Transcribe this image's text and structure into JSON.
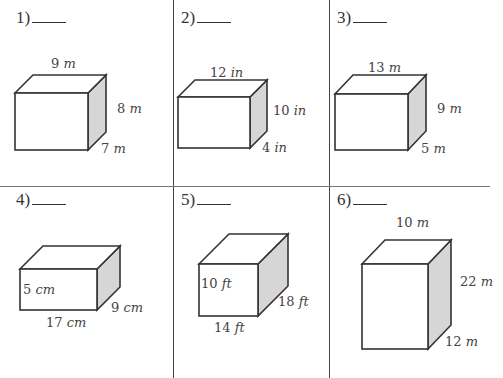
{
  "worksheet": {
    "cut_off_header": "…find the volume of each rectangular prism…",
    "problems": [
      {
        "number": "1)",
        "answer_blank": "",
        "length": "9",
        "height": "8",
        "width": "7",
        "unit": "m",
        "labels": {
          "top": "9 m",
          "right": "8 m",
          "depth": "7 m"
        }
      },
      {
        "number": "2)",
        "answer_blank": "",
        "length": "12",
        "height": "10",
        "width": "4",
        "unit": "in",
        "labels": {
          "top": "12 in",
          "right": "10 in",
          "depth": "4 in"
        }
      },
      {
        "number": "3)",
        "answer_blank": "",
        "length": "13",
        "height": "9",
        "width": "5",
        "unit": "m",
        "labels": {
          "top": "13 m",
          "right": "9 m",
          "depth": "5 m"
        }
      },
      {
        "number": "4)",
        "answer_blank": "",
        "length": "17",
        "height": "5",
        "width": "9",
        "unit": "cm",
        "labels": {
          "front": "5 cm",
          "depth": "9 cm",
          "bottom": "17 cm"
        }
      },
      {
        "number": "5)",
        "answer_blank": "",
        "length": "14",
        "height": "10",
        "width": "18",
        "unit": "ft",
        "labels": {
          "front": "10 ft",
          "depth": "18 ft",
          "bottom": "14 ft"
        }
      },
      {
        "number": "6)",
        "answer_blank": "",
        "length": "10",
        "height": "22",
        "width": "12",
        "unit": "m",
        "labels": {
          "top": "10 m",
          "right": "22 m",
          "depth": "12 m"
        }
      }
    ]
  },
  "colors": {
    "line": "#333333",
    "side_face": "#d6d6d6",
    "grid": "#555555"
  }
}
